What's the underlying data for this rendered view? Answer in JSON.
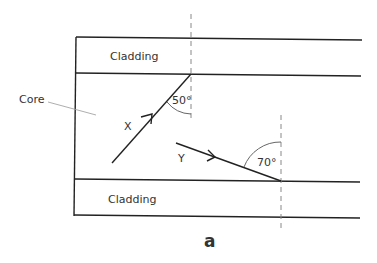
{
  "diagram": {
    "labels": {
      "cladding_top": "Cladding",
      "cladding_bottom": "Cladding",
      "core": "Core",
      "ray_x": "X",
      "ray_y": "Y",
      "angle_x": "50°",
      "angle_y": "70°",
      "figure_label": "a"
    },
    "colors": {
      "line": "#222222",
      "dashed": "#888888",
      "text": "#333333",
      "leader": "#999999"
    }
  }
}
